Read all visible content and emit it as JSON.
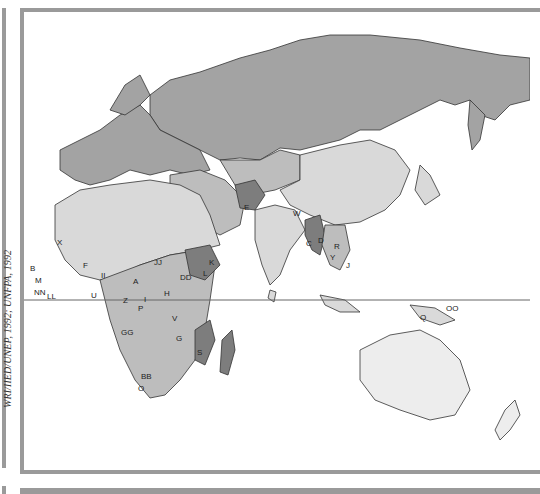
{
  "map": {
    "type": "world map (Eastern Hemisphere)",
    "credit": "WRI/IIED/UNEP, 1992; UNFPA, 1992",
    "colors": {
      "darkest": "#7d7d7d",
      "dark": "#a3a3a3",
      "medium": "#bdbdbd",
      "light": "#d9d9d9",
      "border": "#9a9a9a",
      "ocean": "#ffffff"
    },
    "labels": {
      "X": "X",
      "B": "B",
      "M": "M",
      "NN": "NN",
      "LL": "LL",
      "U": "U",
      "F": "F",
      "II": "II",
      "A": "A",
      "JJ": "JJ",
      "DD": "DD",
      "K": "K",
      "L": "L",
      "H": "H",
      "I": "I",
      "Z": "Z",
      "P": "P",
      "V": "V",
      "GG": "GG",
      "G": "G",
      "S": "S",
      "BB": "BB",
      "O": "O",
      "E": "E",
      "W": "W",
      "C": "C",
      "D": "D",
      "R": "R",
      "Y": "Y",
      "J": "J",
      "Q": "Q",
      "OO": "OO"
    }
  }
}
